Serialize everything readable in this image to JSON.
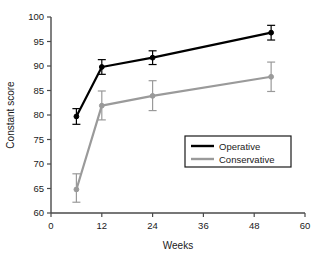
{
  "chart_data": {
    "type": "line",
    "title": "",
    "xlabel": "Weeks",
    "ylabel": "Constant score",
    "xlim": [
      0,
      60
    ],
    "ylim": [
      60,
      100
    ],
    "xticks": [
      0,
      12,
      24,
      36,
      48,
      60
    ],
    "yticks": [
      60,
      65,
      70,
      75,
      80,
      85,
      90,
      95,
      100
    ],
    "grid": false,
    "legend_position": "center-right",
    "x": [
      6,
      12,
      24,
      52
    ],
    "series": [
      {
        "name": "Operative",
        "color": "#000000",
        "values": [
          79.7,
          89.8,
          91.7,
          96.8
        ],
        "err_low": [
          1.6,
          1.5,
          1.4,
          1.5
        ],
        "err_high": [
          1.6,
          1.5,
          1.4,
          1.5
        ],
        "marker": "circle"
      },
      {
        "name": "Conservative",
        "color": "#9a9a9a",
        "values": [
          64.8,
          81.9,
          83.9,
          87.8
        ],
        "err_low": [
          2.6,
          2.9,
          3.0,
          3.0
        ],
        "err_high": [
          3.2,
          3.0,
          3.1,
          3.0
        ],
        "marker": "circle"
      }
    ]
  },
  "axes": {
    "x_tick_labels": [
      "0",
      "12",
      "24",
      "36",
      "48",
      "60"
    ],
    "y_tick_labels": [
      "60",
      "65",
      "70",
      "75",
      "80",
      "85",
      "90",
      "95",
      "100"
    ],
    "x_axis_title": "Weeks",
    "y_axis_title": "Constant score"
  },
  "legend": {
    "entries": [
      {
        "label": "Operative",
        "color": "#000000"
      },
      {
        "label": "Conservative",
        "color": "#9a9a9a"
      }
    ]
  }
}
